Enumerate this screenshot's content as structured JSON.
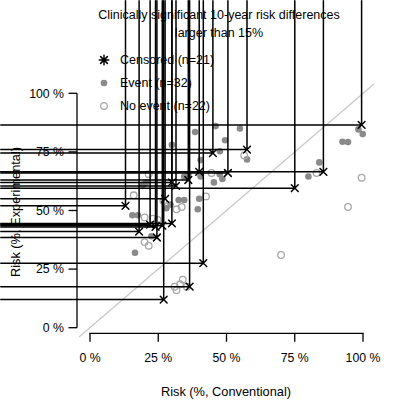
{
  "figure": {
    "title_line1": "Clinically significant 10-year risk differences",
    "title_line2": "larger than 15%",
    "x_axis_label": "Risk (%, Conventional)",
    "y_axis_label": "Risk (%, Experimental)"
  },
  "legend": {
    "position": "top-left",
    "items": [
      {
        "id": "censored",
        "label": "Censored (n=21)",
        "marker": "asterisk-icon",
        "count": 21
      },
      {
        "id": "event",
        "label": "Event (n=32)",
        "marker": "filled-circle-icon",
        "count": 32
      },
      {
        "id": "no_event",
        "label": "No event (n=22)",
        "marker": "open-circle-icon",
        "count": 22
      }
    ]
  },
  "colors": {
    "censored": "#000000",
    "event": "#8a8a8a",
    "no_event": "#a8a8a8",
    "identity_line": "#c9c9c9",
    "axis": "#000000",
    "background": "#ffffff"
  },
  "chart_data": {
    "type": "scatter",
    "title": "Clinically significant 10-year risk differences larger than 15%",
    "xlabel": "Risk (%, Conventional)",
    "ylabel": "Risk (%, Experimental)",
    "xlim": [
      0,
      100
    ],
    "ylim": [
      0,
      100
    ],
    "grid": false,
    "identity_line": true,
    "legend_position": "top-left",
    "x_ticks": [
      0,
      25,
      50,
      75,
      100
    ],
    "y_ticks": [
      0,
      25,
      50,
      75,
      100
    ],
    "x_tick_labels": [
      "0 %",
      "25 %",
      "50 %",
      "75 %",
      "100 %"
    ],
    "y_tick_labels": [
      "0 %",
      "25 %",
      "50 %",
      "75 %",
      "100 %"
    ],
    "series": [
      {
        "name": "Censored (n=21)",
        "marker": "asterisk",
        "color": "#000000",
        "points": [
          [
            13,
            52
          ],
          [
            18,
            41
          ],
          [
            22,
            44
          ],
          [
            24,
            43
          ],
          [
            26.5,
            43.5
          ],
          [
            30,
            44.5
          ],
          [
            24.5,
            38.5
          ],
          [
            27.5,
            55
          ],
          [
            30,
            62
          ],
          [
            31.5,
            60.5
          ],
          [
            36,
            63
          ],
          [
            40,
            66.5
          ],
          [
            45,
            74.5
          ],
          [
            50.5,
            66
          ],
          [
            57.5,
            76
          ],
          [
            27,
            12
          ],
          [
            36.5,
            17.5
          ],
          [
            41.5,
            27.5
          ],
          [
            75,
            59.5
          ],
          [
            85.5,
            66.5
          ],
          [
            99.5,
            86.5
          ]
        ]
      },
      {
        "name": "Event (n=32)",
        "marker": "filled-circle",
        "color": "#8a8a8a",
        "points": [
          [
            15.5,
            48
          ],
          [
            17.5,
            48
          ],
          [
            16.5,
            32
          ],
          [
            20.5,
            62
          ],
          [
            19.5,
            61
          ],
          [
            22.5,
            39
          ],
          [
            28,
            51
          ],
          [
            29.5,
            52.5
          ],
          [
            30,
            78
          ],
          [
            32.5,
            54.5
          ],
          [
            34.5,
            54.5
          ],
          [
            34.5,
            64.5
          ],
          [
            36,
            65.5
          ],
          [
            38.5,
            83.5
          ],
          [
            40,
            55
          ],
          [
            39.5,
            50.5
          ],
          [
            40.5,
            64.5
          ],
          [
            40.5,
            71.5
          ],
          [
            45.4,
            62
          ],
          [
            46,
            86
          ],
          [
            47.5,
            65.5
          ],
          [
            47.6,
            75.3
          ],
          [
            48.5,
            63.5
          ],
          [
            49.5,
            80
          ],
          [
            54.9,
            85
          ],
          [
            57.5,
            71.8
          ],
          [
            80,
            64.5
          ],
          [
            84,
            70.5
          ],
          [
            92.5,
            79.3
          ],
          [
            94.5,
            79.2
          ],
          [
            98.3,
            84.6
          ],
          [
            99.9,
            82.6
          ]
        ]
      },
      {
        "name": "No event (n=22)",
        "marker": "open-circle",
        "color": "#a8a8a8",
        "points": [
          [
            16,
            56.5
          ],
          [
            21.5,
            65.5
          ],
          [
            26.9,
            54
          ],
          [
            31.7,
            50.5
          ],
          [
            33.6,
            51.5
          ],
          [
            20,
            47
          ],
          [
            23,
            46.5
          ],
          [
            24.8,
            46
          ],
          [
            20,
            36.5
          ],
          [
            21.5,
            35
          ],
          [
            31,
            17.5
          ],
          [
            34,
            20.5
          ],
          [
            31.7,
            16
          ],
          [
            35.5,
            17.5
          ],
          [
            33,
            18.5
          ],
          [
            42.5,
            56
          ],
          [
            44.5,
            66
          ],
          [
            56.5,
            73.5
          ],
          [
            70,
            31
          ],
          [
            83,
            66
          ],
          [
            94.5,
            51.5
          ],
          [
            99.5,
            64
          ]
        ]
      }
    ]
  }
}
